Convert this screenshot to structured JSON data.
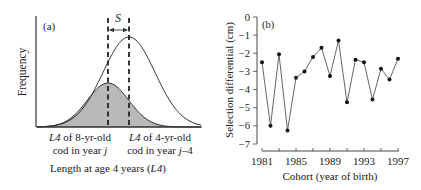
{
  "chart_data": [
    {
      "type": "diagram-distribution",
      "panel_label": "(a)",
      "title": "",
      "ylabel": "Frequency",
      "xlabel_prefix": "Length at age 4 years (",
      "xlabel_italic": "L4",
      "xlabel_suffix": ")",
      "selection_label": "S",
      "annotations": [
        {
          "italic": "L4",
          "text": " of 8-yr-old",
          "line2": "cod in year ",
          "line2_italic": "j",
          "line2_suffix": ""
        },
        {
          "italic": "L4",
          "text": " of 4-yr-old",
          "line2": "cod in year ",
          "line2_italic": "j",
          "line2_suffix": "–4"
        }
      ],
      "curves": [
        {
          "name": "4-yr-old cod in year j-4 (all)",
          "center_px": 129,
          "amplitude_px": 90,
          "sigma_px": 26,
          "filled": false
        },
        {
          "name": "8-yr-old cod in year j (survivors)",
          "center_px": 108,
          "amplitude_px": 44,
          "sigma_px": 20.8,
          "filled": true,
          "fill_color": "#b8b8b8"
        }
      ]
    },
    {
      "type": "line",
      "panel_label": "(b)",
      "title": "",
      "xlabel": "Cohort (year of birth)",
      "ylabel": "Selection differential (cm)",
      "ylim": [
        -7,
        0
      ],
      "xlim": [
        1981,
        1997
      ],
      "yticks": [
        "0",
        "−1",
        "−2",
        "−3",
        "−4",
        "−5",
        "−6",
        "−7"
      ],
      "xticks": [
        "1981",
        "1985",
        "1989",
        "1993",
        "1997"
      ],
      "grid": false,
      "x": [
        1981,
        1982,
        1983,
        1984,
        1985,
        1986,
        1987,
        1988,
        1989,
        1990,
        1991,
        1992,
        1993,
        1994,
        1995,
        1996,
        1997
      ],
      "values": [
        -2.5,
        -6.0,
        -2.05,
        -6.25,
        -3.35,
        -3.0,
        -2.2,
        -1.7,
        -3.25,
        -1.3,
        -4.7,
        -2.35,
        -2.5,
        -4.55,
        -2.85,
        -3.45,
        -2.3
      ],
      "series": [
        {
          "name": "Selection differential",
          "values": [
            -2.5,
            -6.0,
            -2.05,
            -6.25,
            -3.35,
            -3.0,
            -2.2,
            -1.7,
            -3.25,
            -1.3,
            -4.7,
            -2.35,
            -2.5,
            -4.55,
            -2.85,
            -3.45,
            -2.3
          ]
        }
      ]
    }
  ]
}
